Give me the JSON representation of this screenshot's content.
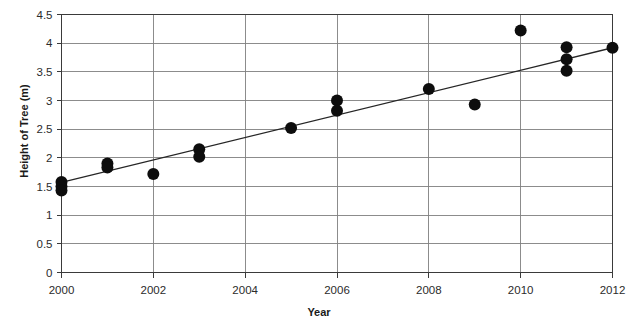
{
  "chart_data": {
    "type": "scatter",
    "title": "",
    "xlabel": "Year",
    "ylabel": "Height of Tree (m)",
    "xlim": [
      2000,
      2012
    ],
    "ylim": [
      0,
      4.5
    ],
    "ytick_step": 0.5,
    "xtick_step": 2,
    "grid": true,
    "grid_color": "#808080",
    "axis_color": "#3a3a3a",
    "marker_color": "#0d0d0d",
    "marker_shape": "circle",
    "marker_radius_px": 6,
    "legend": "none",
    "xticks": [
      "2000",
      "2002",
      "2004",
      "2006",
      "2008",
      "2010",
      "2012"
    ],
    "yticks": [
      "0",
      "0.5",
      "1",
      "1.5",
      "2",
      "2.5",
      "3",
      "3.5",
      "4",
      "4.5"
    ],
    "x": [
      2000,
      2000,
      2000,
      2001,
      2001,
      2002,
      2003,
      2003,
      2005,
      2006,
      2006,
      2008,
      2009,
      2010,
      2011,
      2011,
      2011,
      2012
    ],
    "y": [
      1.58,
      1.5,
      1.43,
      1.9,
      1.83,
      1.72,
      2.15,
      2.02,
      2.52,
      3.0,
      2.82,
      3.2,
      2.93,
      4.22,
      3.93,
      3.72,
      3.52,
      3.92
    ],
    "points": [
      {
        "x": 2000,
        "y": 1.58
      },
      {
        "x": 2000,
        "y": 1.5
      },
      {
        "x": 2000,
        "y": 1.43
      },
      {
        "x": 2001,
        "y": 1.9
      },
      {
        "x": 2001,
        "y": 1.83
      },
      {
        "x": 2002,
        "y": 1.72
      },
      {
        "x": 2003,
        "y": 2.15
      },
      {
        "x": 2003,
        "y": 2.02
      },
      {
        "x": 2005,
        "y": 2.52
      },
      {
        "x": 2006,
        "y": 3.0
      },
      {
        "x": 2006,
        "y": 2.82
      },
      {
        "x": 2008,
        "y": 3.2
      },
      {
        "x": 2009,
        "y": 2.93
      },
      {
        "x": 2010,
        "y": 4.22
      },
      {
        "x": 2011,
        "y": 3.93
      },
      {
        "x": 2011,
        "y": 3.72
      },
      {
        "x": 2011,
        "y": 3.52
      },
      {
        "x": 2012,
        "y": 3.92
      }
    ],
    "trendline": {
      "type": "line",
      "color": "#262626",
      "x_start": 2000,
      "y_start": 1.57,
      "x_end": 2012,
      "y_end": 3.92
    }
  }
}
